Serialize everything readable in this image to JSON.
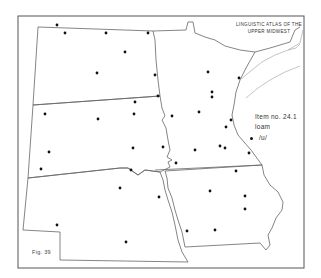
{
  "map": {
    "title_line1": "LINGUISTIC ATLAS OF THE",
    "title_line2": "UPPER MIDWEST",
    "item_number": "Item no. 24.1",
    "item_word": "loam",
    "legend": [
      {
        "symbol": "dot",
        "label": "/u/"
      }
    ],
    "figure_label": "Fig. 39",
    "regions": [
      "North Dakota",
      "South Dakota",
      "Nebraska",
      "Minnesota",
      "Iowa"
    ],
    "dot_color": "#111111",
    "line_color": "#666666",
    "points": [
      [
        57,
        25
      ],
      [
        65,
        33
      ],
      [
        106,
        33
      ],
      [
        148,
        33
      ],
      [
        125,
        52
      ],
      [
        97,
        73
      ],
      [
        155,
        75
      ],
      [
        158,
        96
      ],
      [
        135,
        102
      ],
      [
        45,
        114
      ],
      [
        98,
        119
      ],
      [
        134,
        114
      ],
      [
        172,
        116
      ],
      [
        49,
        152
      ],
      [
        133,
        148
      ],
      [
        163,
        147
      ],
      [
        41,
        169
      ],
      [
        131,
        170
      ],
      [
        176,
        163
      ],
      [
        120,
        188
      ],
      [
        159,
        197
      ],
      [
        57,
        225
      ],
      [
        126,
        242
      ],
      [
        208,
        72
      ],
      [
        239,
        78
      ],
      [
        212,
        92
      ],
      [
        212,
        97
      ],
      [
        199,
        112
      ],
      [
        231,
        120
      ],
      [
        226,
        127
      ],
      [
        195,
        150
      ],
      [
        220,
        146
      ],
      [
        225,
        148
      ],
      [
        249,
        153
      ],
      [
        236,
        171
      ],
      [
        210,
        191
      ],
      [
        245,
        196
      ],
      [
        245,
        209
      ],
      [
        187,
        231
      ],
      [
        215,
        230
      ]
    ]
  }
}
